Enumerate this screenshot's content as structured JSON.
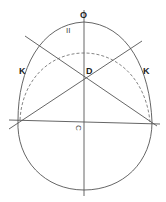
{
  "figure": {
    "colors": {
      "line": "#555555",
      "label": "#222222",
      "background": "#ffffff"
    },
    "labels": {
      "top": "O",
      "upper_small": "II",
      "center": "D",
      "left_side": "K",
      "right_side": "K",
      "lower_center": "C"
    }
  }
}
